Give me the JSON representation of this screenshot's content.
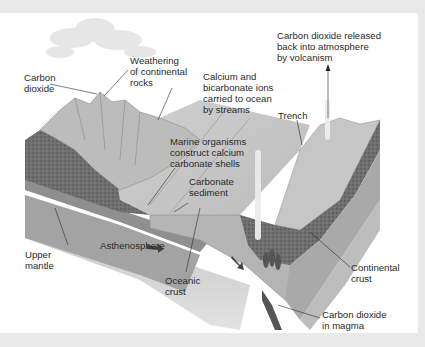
{
  "diagram": {
    "colors": {
      "frame": "#e9e9e9",
      "background": "#ffffff",
      "continental_crust": "#6f6f6f",
      "oceanic_crust": "#a9a9a9",
      "upper_mantle": "#9c9c9c",
      "asthenosphere": "#c9c9c9",
      "ocean_surface": "#d6d6d6",
      "land": "#bdbdbd",
      "text": "#2a2a2a"
    },
    "labels": {
      "carbon_dioxide": "Carbon\ndioxide",
      "weathering": "Weathering\nof continental\nrocks",
      "ions": "Calcium and\nbicarbonate ions\ncarried to ocean\nby streams",
      "volcanism": "Carbon dioxide released\nback into atmosphere\nby volcanism",
      "trench": "Trench",
      "marine_organisms": "Marine organisms\nconstruct calcium\ncarbonate shells",
      "carbonate_sediment": "Carbonate\nsediment",
      "upper_mantle": "Upper\nmantle",
      "asthenosphere": "Asthenosphere",
      "oceanic_crust": "Oceanic\ncrust",
      "continental_crust": "Continental\ncrust",
      "co2_in_magma": "Carbon dioxide\nin magma"
    }
  }
}
